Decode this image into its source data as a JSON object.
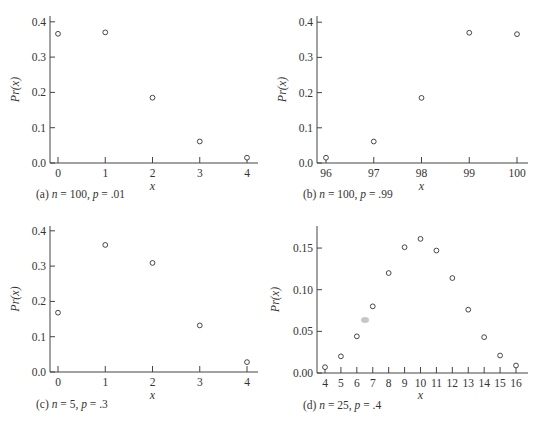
{
  "chart_data": [
    {
      "type": "scatter",
      "id": "a",
      "caption": "(a) n = 100, p = .01",
      "caption_parts": {
        "prefix": "(a) ",
        "n": "100",
        "p": ".01"
      },
      "xlabel": "x",
      "ylabel": "Pr(x)",
      "x": [
        0,
        1,
        2,
        3,
        4
      ],
      "values": [
        0.366,
        0.37,
        0.185,
        0.061,
        0.015
      ],
      "xticks": [
        "0",
        "1",
        "2",
        "3",
        "4"
      ],
      "yticks": [
        "0.0",
        "0.1",
        "0.2",
        "0.3",
        "0.4"
      ],
      "ylim": [
        0,
        0.4
      ]
    },
    {
      "type": "scatter",
      "id": "b",
      "caption": "(b) n = 100, p = .99",
      "caption_parts": {
        "prefix": "(b) ",
        "n": "100",
        "p": ".99"
      },
      "xlabel": "x",
      "ylabel": "Pr(x)",
      "x": [
        96,
        97,
        98,
        99,
        100
      ],
      "values": [
        0.015,
        0.061,
        0.185,
        0.37,
        0.366
      ],
      "xticks": [
        "96",
        "97",
        "98",
        "99",
        "100"
      ],
      "yticks": [
        "0.0",
        "0.1",
        "0.2",
        "0.3",
        "0.4"
      ],
      "ylim": [
        0,
        0.4
      ]
    },
    {
      "type": "scatter",
      "id": "c",
      "caption": "(c) n = 5, p = .3",
      "caption_parts": {
        "prefix": "(c) ",
        "n": "5",
        "p": ".3"
      },
      "xlabel": "x",
      "ylabel": "Pr(x)",
      "x": [
        0,
        1,
        2,
        3,
        4
      ],
      "values": [
        0.168,
        0.36,
        0.309,
        0.132,
        0.028
      ],
      "xticks": [
        "0",
        "1",
        "2",
        "3",
        "4"
      ],
      "yticks": [
        "0.0",
        "0.1",
        "0.2",
        "0.3",
        "0.4"
      ],
      "ylim": [
        0,
        0.4
      ]
    },
    {
      "type": "scatter",
      "id": "d",
      "caption": "(d) n = 25, p = .4",
      "caption_parts": {
        "prefix": "(d) ",
        "n": "25",
        "p": ".4"
      },
      "xlabel": "x",
      "ylabel": "Pr(x)",
      "x": [
        4,
        5,
        6,
        7,
        8,
        9,
        10,
        11,
        12,
        13,
        14,
        15,
        16
      ],
      "values": [
        0.007,
        0.02,
        0.044,
        0.08,
        0.12,
        0.151,
        0.161,
        0.147,
        0.114,
        0.076,
        0.043,
        0.021,
        0.009
      ],
      "xticks": [
        "4",
        "5",
        "6",
        "7",
        "8",
        "9",
        "10",
        "11",
        "12",
        "13",
        "14",
        "15",
        "16"
      ],
      "yticks": [
        "0.00",
        "0.05",
        "0.10",
        "0.15"
      ],
      "ylim": [
        0,
        0.17
      ]
    }
  ]
}
